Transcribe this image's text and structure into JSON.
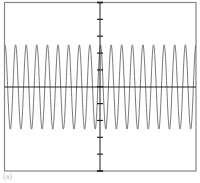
{
  "chart_data": {
    "type": "line",
    "title": "",
    "xlabel": "",
    "ylabel": "",
    "caption": "(a)",
    "waveform": "cosine",
    "cycles": 18,
    "amplitude": 2.5,
    "x_range": [
      0,
      18
    ],
    "ylim": [
      -5,
      5
    ],
    "y_divisions": 10,
    "grid": false,
    "axes": "center-cross",
    "colors": {
      "frame": "#888888",
      "axis": "#222222",
      "trace": "#555555",
      "tick": "#222222"
    }
  }
}
